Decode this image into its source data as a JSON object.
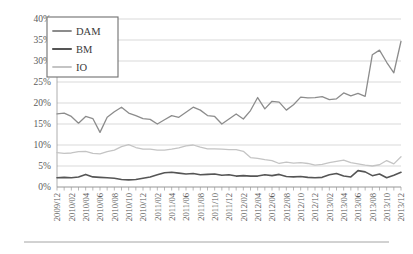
{
  "chart_data": {
    "type": "line",
    "title": "",
    "xlabel": "",
    "ylabel": "",
    "ylim": [
      0,
      40
    ],
    "ytick_labels": [
      "0%",
      "5%",
      "10%",
      "15%",
      "20%",
      "25%",
      "30%",
      "35%",
      "40%"
    ],
    "ytick_values": [
      0,
      5,
      10,
      15,
      20,
      25,
      30,
      35,
      40
    ],
    "grid": true,
    "legend_position": "top-left",
    "legend_entries": [
      "DAM",
      "BM",
      "IO"
    ],
    "x": [
      "2009/12",
      "2010/01",
      "2010/02",
      "2010/03",
      "2010/04",
      "2010/05",
      "2010/06",
      "2010/07",
      "2010/08",
      "2010/09",
      "2010/10",
      "2010/11",
      "2010/12",
      "2011/01",
      "2011/02",
      "2011/03",
      "2011/04",
      "2011/05",
      "2011/06",
      "2011/07",
      "2011/08",
      "2011/09",
      "2011/10",
      "2011/11",
      "2011/12",
      "2012/01",
      "2012/02",
      "2012/03",
      "2012/04",
      "2012/05",
      "2012/06",
      "2012/07",
      "2012/08",
      "2012/09",
      "2012/10",
      "2012/11",
      "2012/12",
      "2013/01",
      "2013/02",
      "2013/03",
      "2013/04",
      "2013/05",
      "2013/06",
      "2013/07",
      "2013/08",
      "2013/09",
      "2013/10",
      "2013/11",
      "2013/12"
    ],
    "xtick_labels_shown": [
      "2009/12",
      "2010/02",
      "2010/04",
      "2010/06",
      "2010/08",
      "2010/10",
      "2010/12",
      "2011/02",
      "2011/04",
      "2011/06",
      "2011/08",
      "2011/10",
      "2011/12",
      "2012/02",
      "2012/04",
      "2012/06",
      "2012/08",
      "2012/10",
      "2012/12",
      "2013/02",
      "2013/04",
      "2013/06",
      "2013/08",
      "2013/10",
      "2013/12"
    ],
    "series": [
      {
        "name": "DAM",
        "color": "#8c8c8c",
        "width": 1.3,
        "values": [
          17.4,
          17.6,
          16.8,
          15.2,
          16.8,
          16.3,
          13.0,
          16.6,
          17.9,
          19.0,
          17.6,
          17.0,
          16.3,
          16.1,
          15.0,
          16.0,
          17.0,
          16.6,
          17.8,
          19.0,
          18.3,
          17.0,
          16.8,
          15.0,
          16.2,
          17.4,
          16.2,
          18.2,
          21.3,
          18.6,
          20.4,
          20.2,
          18.3,
          19.6,
          21.4,
          21.2,
          21.3,
          21.5,
          20.8,
          21.0,
          22.4,
          21.7,
          22.3,
          21.6,
          31.5,
          32.6,
          29.7,
          27.2,
          34.7
        ]
      },
      {
        "name": "BM",
        "color": "#555555",
        "width": 1.6,
        "values": [
          2.2,
          2.3,
          2.2,
          2.4,
          3.0,
          2.4,
          2.3,
          2.2,
          2.1,
          1.8,
          1.7,
          1.8,
          2.1,
          2.4,
          2.9,
          3.4,
          3.5,
          3.3,
          3.1,
          3.2,
          2.9,
          3.0,
          3.1,
          2.8,
          2.9,
          2.6,
          2.7,
          2.6,
          2.6,
          2.9,
          2.7,
          3.0,
          2.5,
          2.4,
          2.5,
          2.3,
          2.2,
          2.3,
          2.9,
          3.2,
          2.6,
          2.4,
          3.9,
          3.6,
          2.7,
          3.1,
          2.2,
          2.8,
          3.5
        ]
      },
      {
        "name": "IO",
        "color": "#c4c4c4",
        "width": 1.3,
        "values": [
          8.2,
          8.0,
          8.1,
          8.4,
          8.5,
          8.0,
          7.9,
          8.4,
          8.8,
          9.6,
          10.1,
          9.4,
          9.0,
          9.0,
          8.8,
          8.8,
          9.0,
          9.3,
          9.8,
          10.0,
          9.5,
          9.1,
          9.1,
          9.0,
          8.9,
          8.9,
          8.5,
          7.0,
          6.8,
          6.5,
          6.3,
          5.6,
          5.9,
          5.7,
          5.8,
          5.6,
          5.2,
          5.4,
          5.8,
          6.1,
          6.4,
          5.8,
          5.5,
          5.2,
          5.0,
          5.3,
          6.3,
          5.5,
          7.2
        ]
      }
    ]
  }
}
